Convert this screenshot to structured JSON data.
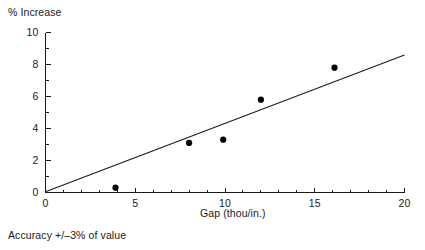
{
  "chart_data": {
    "type": "scatter",
    "title": "",
    "ylabel": "% Increase",
    "xlabel": "Gap (thou/in.)",
    "xlim": [
      0,
      20
    ],
    "ylim": [
      0,
      10
    ],
    "xticks": [
      0,
      5,
      10,
      15,
      20
    ],
    "xtick_labels": [
      "0",
      "5",
      "10",
      "15",
      "20"
    ],
    "xtick_minor_step": 1,
    "yticks": [
      0,
      2,
      4,
      6,
      8,
      10
    ],
    "ytick_labels": [
      "0",
      "2",
      "4",
      "6",
      "8",
      "10"
    ],
    "ytick_minor_step": 1,
    "grid": false,
    "legend": false,
    "series": [
      {
        "name": "measured points",
        "marker": "filled-circle",
        "color": "#000000",
        "points": [
          {
            "x": 3.9,
            "y": 0.3
          },
          {
            "x": 8.0,
            "y": 3.1
          },
          {
            "x": 9.9,
            "y": 3.3
          },
          {
            "x": 12.0,
            "y": 5.8
          },
          {
            "x": 16.1,
            "y": 7.8
          }
        ]
      },
      {
        "name": "fit line",
        "marker": "line",
        "color": "#1a1a1a",
        "line": {
          "x0": 0.0,
          "y0": 0.05,
          "x1": 20.0,
          "y1": 8.6
        }
      }
    ],
    "annotations": [
      {
        "text": "Accuracy +/-3% of value",
        "position": "below-axis-left"
      }
    ]
  },
  "labels": {
    "y_axis_title": "% Increase",
    "x_axis_title": "Gap (thou/in.)",
    "footnote": "Accuracy +/–3% of value"
  }
}
